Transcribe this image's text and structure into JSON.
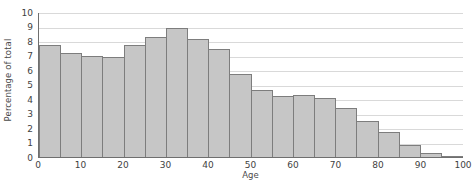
{
  "chart_data": {
    "type": "bar",
    "title": "",
    "subtitle": "",
    "xlabel": "Age",
    "ylabel": "Percentage of total",
    "xlim": [
      0,
      100
    ],
    "ylim": [
      0,
      10
    ],
    "grid": true,
    "legend": null,
    "bin_width": 5,
    "bar_color": "#c6c6c6",
    "bar_edge_color": "#7d7d7d",
    "grid_color": "#d9d9d9",
    "axis_color": "#6f6f6f",
    "categories": [
      "0-5",
      "5-10",
      "10-15",
      "15-20",
      "20-25",
      "25-30",
      "30-35",
      "35-40",
      "40-45",
      "45-50",
      "50-55",
      "55-60",
      "60-65",
      "65-70",
      "70-75",
      "75-80",
      "80-85",
      "85-90",
      "90-95",
      "95-100"
    ],
    "bin_starts": [
      0,
      5,
      10,
      15,
      20,
      25,
      30,
      35,
      40,
      45,
      50,
      55,
      60,
      65,
      70,
      75,
      80,
      85,
      90,
      95
    ],
    "values": [
      7.7,
      7.2,
      7.0,
      6.9,
      7.7,
      8.3,
      8.9,
      8.15,
      7.45,
      5.7,
      4.6,
      4.2,
      4.25,
      4.1,
      3.4,
      2.5,
      1.7,
      0.8,
      0.25,
      0.08
    ],
    "ytick_labels": [
      "10",
      "9",
      "8",
      "7",
      "6",
      "5",
      "4",
      "3",
      "2",
      "1",
      "0"
    ],
    "ytick_values": [
      10,
      9,
      8,
      7,
      6,
      5,
      4,
      3,
      2,
      1,
      0
    ],
    "xtick_labels": [
      "0",
      "10",
      "20",
      "30",
      "40",
      "50",
      "60",
      "70",
      "80",
      "90",
      "100"
    ],
    "xtick_values": [
      0,
      10,
      20,
      30,
      40,
      50,
      60,
      70,
      80,
      90,
      100
    ]
  }
}
